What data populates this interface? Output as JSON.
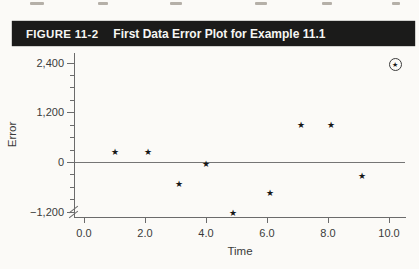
{
  "page": {
    "figure_label": "FIGURE 11-2",
    "figure_title": "First Data Error Plot for Example 11.1",
    "top_remnants": [
      {
        "x": 30,
        "w": 14
      },
      {
        "x": 98,
        "w": 10
      },
      {
        "x": 170,
        "w": 12
      },
      {
        "x": 255,
        "w": 12
      },
      {
        "x": 322,
        "w": 10
      },
      {
        "x": 392,
        "w": 8
      }
    ]
  },
  "chart_data": {
    "type": "scatter",
    "title": "First Data Error Plot for Example 11.1",
    "xlabel": "Time",
    "ylabel": "Error",
    "marker": "star",
    "marker_glyph": "★",
    "xlim": [
      -0.35,
      10.55
    ],
    "ylim": [
      -1350,
      2650
    ],
    "grid": false,
    "zero_line": true,
    "axis_break_bottom_left": true,
    "x_ticks": {
      "values": [
        0,
        2,
        4,
        6,
        8,
        10
      ],
      "labels": [
        "0.0",
        "2.0",
        "4.0",
        "6.0",
        "8.0",
        "10.0"
      ]
    },
    "y_ticks": {
      "major_values": [
        -1200,
        0,
        1200,
        2400
      ],
      "major_labels": [
        "−1,200",
        "0",
        "1,200",
        "2,400"
      ],
      "minor_step": 300
    },
    "points": [
      {
        "x": 1.0,
        "y": 250,
        "circled": false
      },
      {
        "x": 2.1,
        "y": 250,
        "circled": false
      },
      {
        "x": 3.1,
        "y": -530,
        "circled": false
      },
      {
        "x": 4.0,
        "y": -60,
        "circled": false
      },
      {
        "x": 4.9,
        "y": -1230,
        "circled": false
      },
      {
        "x": 6.1,
        "y": -760,
        "circled": false
      },
      {
        "x": 7.1,
        "y": 900,
        "circled": false
      },
      {
        "x": 8.1,
        "y": 900,
        "circled": false
      },
      {
        "x": 9.1,
        "y": -340,
        "circled": false
      },
      {
        "x": 10.2,
        "y": 2350,
        "circled": true
      }
    ],
    "colors": {
      "axis": "#6b6b6b",
      "labels": "#3a3a3a",
      "marker": "#171717",
      "header_bar": "#1b1b1a",
      "header_text": "#f6f6f3",
      "paper": "#fbfaf7"
    }
  }
}
